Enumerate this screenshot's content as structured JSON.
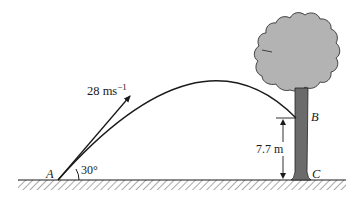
{
  "diagram": {
    "type": "projectile-motion",
    "points": {
      "A": "A",
      "B": "B",
      "C": "C"
    },
    "velocity": {
      "value": "28 m",
      "unit_s": "s",
      "exponent": "−1"
    },
    "angle": "30°",
    "height": "7.7 m",
    "colors": {
      "line": "#1a1a1a",
      "crown_fill": "#b3b3b3",
      "trunk_fill": "#6b6b6b",
      "background": "#ffffff"
    }
  }
}
